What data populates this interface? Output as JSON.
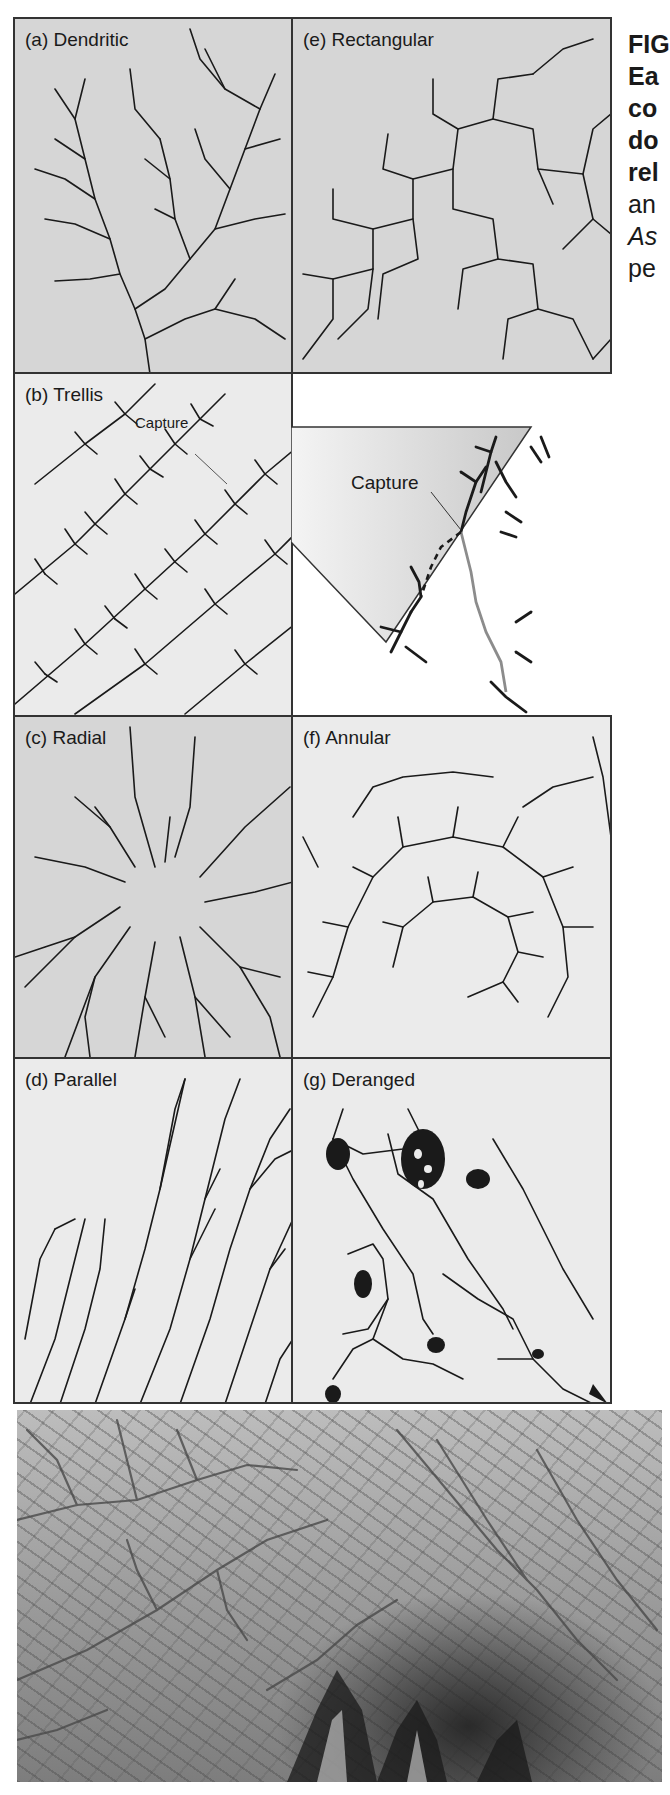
{
  "figure": {
    "caption_lines": [
      {
        "text": "FIG",
        "style": "bold"
      },
      {
        "text": "Ea",
        "style": "bold"
      },
      {
        "text": "co",
        "style": "bold"
      },
      {
        "text": "do",
        "style": "bold"
      },
      {
        "text": "rel",
        "style": "bold"
      },
      {
        "text": "an",
        "style": "normal"
      },
      {
        "text": "As",
        "style": "italic"
      },
      {
        "text": "pe",
        "style": "normal"
      }
    ],
    "panels": {
      "a": {
        "label": "(a) Dendritic"
      },
      "e": {
        "label": "(e) Rectangular"
      },
      "b": {
        "label": "(b) Trellis",
        "callout": "Capture"
      },
      "inset": {
        "callout": "Capture"
      },
      "c": {
        "label": "(c) Radial"
      },
      "f": {
        "label": "(f) Annular"
      },
      "d": {
        "label": "(d) Parallel"
      },
      "g": {
        "label": "(g) Deranged"
      }
    },
    "photo": {
      "description": "Aerial photograph of dendritic drainage terrain"
    },
    "colors": {
      "panel_gray": "#d6d6d6",
      "panel_light": "#ebebeb",
      "stream": "#1a1a1a",
      "captured_stream": "#8c8c8c",
      "border": "#333333"
    }
  }
}
